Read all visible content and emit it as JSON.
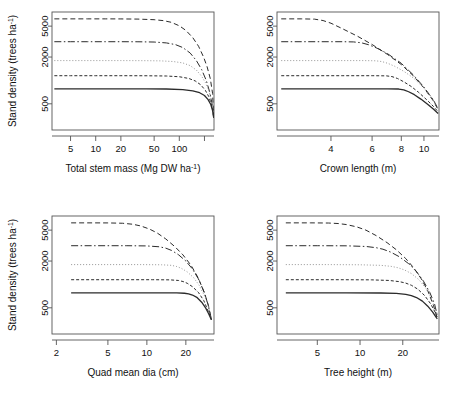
{
  "figure": {
    "background": "#ffffff",
    "line_color": "#2b2b2b",
    "panel_count": 4,
    "shared_ylabel": "Stand density (trees ha",
    "shared_ylabel_sup": "-1",
    "shared_ylabel_close": ")"
  },
  "series_styles": [
    {
      "name": "curve-1-dashed",
      "dash": "5,3",
      "width": 1.0,
      "color": "#2b2b2b"
    },
    {
      "name": "curve-2-dashdot",
      "dash": "7,2.5,1.5,2.5",
      "width": 1.0,
      "color": "#2b2b2b"
    },
    {
      "name": "curve-3-dotted",
      "dash": "1,2",
      "width": 0.9,
      "color": "#8a8a8a"
    },
    {
      "name": "curve-4-shortdash",
      "dash": "3,2",
      "width": 1.0,
      "color": "#2b2b2b"
    },
    {
      "name": "curve-5-solid",
      "dash": "0",
      "width": 1.3,
      "color": "#2b2b2b"
    }
  ],
  "chart_data": [
    {
      "type": "line",
      "panel": "top-left",
      "title": "",
      "xlabel": "Total stem mass (Mg DW ha",
      "xlabel_sup": "-1",
      "xlabel_close": ")",
      "ylabel": "Stand density (trees ha",
      "ylabel_sup": "-1",
      "ylabel_close": ")",
      "xscale": "log",
      "yscale": "log",
      "xlim": [
        3.0,
        260.0
      ],
      "ylim": [
        230,
        7600
      ],
      "xticks": [
        5,
        10,
        20,
        50,
        100
      ],
      "xticklabels": [
        "5",
        "10",
        "20",
        "50",
        "100"
      ],
      "xticks_unlabeled": [
        200
      ],
      "yticks": [
        500,
        2000,
        5000
      ],
      "yticklabels": [
        "500",
        "2000",
        "5000"
      ],
      "grid": false,
      "legend": "none",
      "series": [
        {
          "name": "curve-1-dashed",
          "plateau": 6200,
          "x": [
            3.2,
            5,
            8,
            13,
            20,
            32,
            50,
            65,
            80,
            100,
            120,
            145,
            170,
            195,
            215,
            235,
            250,
            258
          ],
          "y": [
            6200,
            6200,
            6200,
            6200,
            6190,
            6160,
            6050,
            5880,
            5600,
            5050,
            4400,
            3550,
            2750,
            2000,
            1500,
            1050,
            680,
            330
          ]
        },
        {
          "name": "curve-2-dashdot",
          "plateau": 3150,
          "x": [
            3.2,
            5,
            8,
            13,
            20,
            32,
            50,
            70,
            90,
            110,
            135,
            160,
            185,
            210,
            230,
            245,
            255,
            258
          ],
          "y": [
            3150,
            3150,
            3150,
            3150,
            3150,
            3145,
            3120,
            3040,
            2890,
            2650,
            2250,
            1800,
            1380,
            1000,
            720,
            520,
            390,
            330
          ]
        },
        {
          "name": "curve-3-dotted",
          "plateau": 1800,
          "x": [
            3.2,
            5,
            10,
            20,
            40,
            60,
            85,
            110,
            135,
            160,
            185,
            205,
            225,
            240,
            252,
            258
          ],
          "y": [
            1800,
            1800,
            1800,
            1800,
            1795,
            1785,
            1750,
            1680,
            1550,
            1360,
            1130,
            940,
            740,
            580,
            430,
            330
          ]
        },
        {
          "name": "curve-4-shortdash",
          "plateau": 1150,
          "x": [
            3.2,
            5,
            10,
            20,
            40,
            70,
            100,
            130,
            155,
            180,
            205,
            225,
            240,
            250,
            258
          ],
          "y": [
            1150,
            1150,
            1150,
            1150,
            1148,
            1140,
            1115,
            1060,
            985,
            880,
            745,
            620,
            505,
            420,
            330
          ]
        },
        {
          "name": "curve-5-solid",
          "plateau": 780,
          "x": [
            3.2,
            5,
            10,
            20,
            40,
            70,
            110,
            145,
            175,
            200,
            220,
            238,
            250,
            258
          ],
          "y": [
            780,
            780,
            780,
            780,
            780,
            776,
            762,
            735,
            695,
            640,
            570,
            490,
            410,
            330
          ]
        }
      ]
    },
    {
      "type": "line",
      "panel": "top-right",
      "title": "",
      "xlabel": "Crown length (m)",
      "ylabel": "",
      "xscale": "log",
      "yscale": "log",
      "xlim": [
        2.35,
        11.6
      ],
      "ylim": [
        230,
        7600
      ],
      "xticks": [
        4,
        6,
        8,
        10
      ],
      "xticklabels": [
        "4",
        "6",
        "8",
        "10"
      ],
      "yticks": [
        500,
        2000,
        5000
      ],
      "yticklabels": [
        "500",
        "2000",
        "5000"
      ],
      "grid": false,
      "legend": "none",
      "series": [
        {
          "name": "curve-1-dashed",
          "plateau": 6200,
          "x": [
            2.45,
            3.0,
            3.4,
            3.7,
            4.0,
            4.5,
            5.2,
            6.0,
            7.0,
            8.0,
            9.0,
            10.0,
            11.0,
            11.5
          ],
          "y": [
            6200,
            6200,
            6150,
            5900,
            5450,
            4600,
            3700,
            2900,
            2150,
            1600,
            1150,
            800,
            540,
            420
          ]
        },
        {
          "name": "curve-2-dashdot",
          "plateau": 3150,
          "x": [
            2.45,
            3.5,
            4.5,
            5.0,
            5.4,
            5.8,
            6.3,
            7.0,
            8.0,
            9.0,
            10.0,
            11.0,
            11.5
          ],
          "y": [
            3150,
            3150,
            3150,
            3130,
            3050,
            2880,
            2600,
            2200,
            1660,
            1180,
            820,
            555,
            425
          ]
        },
        {
          "name": "curve-3-dotted",
          "plateau": 1800,
          "x": [
            2.45,
            4.0,
            5.5,
            6.2,
            6.6,
            7.0,
            7.5,
            8.2,
            9.0,
            10.0,
            11.0,
            11.5
          ],
          "y": [
            1800,
            1800,
            1800,
            1790,
            1750,
            1660,
            1520,
            1310,
            1080,
            800,
            560,
            430
          ]
        },
        {
          "name": "curve-4-shortdash",
          "plateau": 1150,
          "x": [
            2.45,
            4.5,
            6.0,
            6.9,
            7.3,
            7.7,
            8.2,
            8.8,
            9.5,
            10.3,
            11.0,
            11.5
          ],
          "y": [
            1150,
            1150,
            1150,
            1145,
            1120,
            1060,
            960,
            840,
            700,
            560,
            460,
            395
          ]
        },
        {
          "name": "curve-5-solid",
          "plateau": 780,
          "x": [
            2.45,
            5.0,
            7.0,
            7.8,
            8.2,
            8.6,
            9.1,
            9.7,
            10.4,
            11.0,
            11.5
          ],
          "y": [
            780,
            780,
            780,
            775,
            755,
            715,
            655,
            575,
            490,
            425,
            375
          ]
        }
      ]
    },
    {
      "type": "line",
      "panel": "bottom-left",
      "title": "",
      "xlabel": "Quad mean dia (cm)",
      "ylabel": "Stand density (trees ha",
      "ylabel_sup": "-1",
      "ylabel_close": ")",
      "xscale": "log",
      "yscale": "log",
      "xlim": [
        1.85,
        33.0
      ],
      "ylim": [
        230,
        7600
      ],
      "xticks": [
        2,
        5,
        10,
        20
      ],
      "xticklabels": [
        "2",
        "5",
        "10",
        "20"
      ],
      "yticks": [
        500,
        2000,
        5000
      ],
      "yticklabels": [
        "500",
        "2000",
        "5000"
      ],
      "grid": false,
      "legend": "none",
      "series": [
        {
          "name": "curve-1-dashed",
          "plateau": 6200,
          "x": [
            2.6,
            3.5,
            5,
            6.5,
            7.8,
            9.0,
            10.5,
            12.0,
            14.0,
            16.5,
            19.0,
            22.0,
            25.0,
            28.0,
            30.0,
            31.5
          ],
          "y": [
            6200,
            6200,
            6190,
            6130,
            5950,
            5650,
            5150,
            4600,
            3850,
            3050,
            2400,
            1750,
            1200,
            760,
            520,
            350
          ]
        },
        {
          "name": "curve-2-dashdot",
          "plateau": 3150,
          "x": [
            2.6,
            4,
            7,
            10,
            12.5,
            14.0,
            15.5,
            17.5,
            20.0,
            22.5,
            25.0,
            27.5,
            29.5,
            31.5
          ],
          "y": [
            3150,
            3150,
            3150,
            3130,
            3050,
            2930,
            2740,
            2420,
            2000,
            1580,
            1180,
            820,
            570,
            360
          ]
        },
        {
          "name": "curve-3-dotted",
          "plateau": 1800,
          "x": [
            2.6,
            5,
            9,
            13,
            15.5,
            17.0,
            18.5,
            20.5,
            23.0,
            25.5,
            28.0,
            30.0,
            31.5
          ],
          "y": [
            1800,
            1800,
            1800,
            1790,
            1760,
            1700,
            1610,
            1450,
            1220,
            960,
            700,
            500,
            360
          ]
        },
        {
          "name": "curve-4-shortdash",
          "plateau": 1150,
          "x": [
            2.6,
            6,
            11,
            15,
            17.5,
            19.0,
            20.5,
            22.5,
            25.0,
            27.5,
            29.5,
            31.5
          ],
          "y": [
            1150,
            1150,
            1150,
            1145,
            1125,
            1090,
            1035,
            935,
            790,
            620,
            470,
            355
          ]
        },
        {
          "name": "curve-5-solid",
          "plateau": 780,
          "x": [
            2.6,
            7,
            13,
            17,
            19.5,
            21.0,
            22.5,
            24.5,
            26.5,
            28.5,
            30.0,
            31.5
          ],
          "y": [
            780,
            780,
            780,
            778,
            770,
            755,
            730,
            675,
            590,
            495,
            420,
            350
          ]
        }
      ]
    },
    {
      "type": "line",
      "panel": "bottom-right",
      "title": "",
      "xlabel": "Tree height (m)",
      "ylabel": "",
      "xscale": "log",
      "yscale": "log",
      "xlim": [
        2.6,
        36.0
      ],
      "ylim": [
        230,
        7600
      ],
      "xticks": [
        5,
        10,
        20
      ],
      "xticklabels": [
        "5",
        "10",
        "20"
      ],
      "yticks": [
        500,
        2000,
        5000
      ],
      "yticklabels": [
        "500",
        "2000",
        "5000"
      ],
      "grid": false,
      "legend": "none",
      "series": [
        {
          "name": "curve-1-dashed",
          "plateau": 6200,
          "x": [
            3.0,
            4.5,
            6.0,
            7.0,
            8.0,
            9.5,
            11.0,
            13.0,
            15.5,
            18.0,
            21.0,
            24.0,
            27.0,
            30.0,
            33.0,
            35.0
          ],
          "y": [
            6200,
            6200,
            6170,
            6080,
            5900,
            5500,
            5000,
            4250,
            3450,
            2800,
            2150,
            1620,
            1180,
            830,
            530,
            360
          ]
        },
        {
          "name": "curve-2-dashdot",
          "plateau": 3150,
          "x": [
            3.0,
            5,
            8,
            11,
            13,
            14.5,
            16.5,
            19.0,
            22.0,
            25.0,
            28.0,
            31.0,
            33.5,
            35.0
          ],
          "y": [
            3150,
            3150,
            3140,
            3080,
            2970,
            2840,
            2600,
            2260,
            1850,
            1460,
            1100,
            790,
            560,
            400
          ]
        },
        {
          "name": "curve-3-dotted",
          "plateau": 1800,
          "x": [
            3.0,
            6,
            10,
            14,
            16.5,
            18.5,
            20.5,
            23.0,
            26.0,
            29.0,
            32.0,
            34.0,
            35.0
          ],
          "y": [
            1800,
            1800,
            1790,
            1760,
            1710,
            1640,
            1540,
            1380,
            1150,
            900,
            650,
            490,
            410
          ]
        },
        {
          "name": "curve-4-shortdash",
          "plateau": 1150,
          "x": [
            3.0,
            7,
            12,
            16,
            19,
            21,
            23,
            25.5,
            28.5,
            31.5,
            34.0,
            35.0
          ],
          "y": [
            1150,
            1150,
            1145,
            1125,
            1085,
            1040,
            975,
            870,
            720,
            560,
            430,
            380
          ]
        },
        {
          "name": "curve-5-solid",
          "plateau": 780,
          "x": [
            3.0,
            8,
            14,
            18,
            21,
            23,
            25,
            27.5,
            30.0,
            32.5,
            34.5,
            35.0
          ],
          "y": [
            780,
            780,
            776,
            765,
            745,
            718,
            678,
            610,
            525,
            440,
            375,
            360
          ]
        }
      ]
    }
  ]
}
